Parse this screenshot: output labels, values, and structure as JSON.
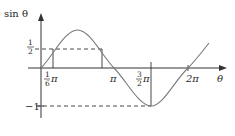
{
  "diagram": {
    "type": "function-graph",
    "function": "sin θ",
    "y_axis_label": "sin θ",
    "x_axis_label": "θ",
    "y_ticks": [
      {
        "label_num": "1",
        "label_den": "2",
        "value": 0.5
      },
      {
        "label": "−1",
        "value": -1
      }
    ],
    "x_ticks": [
      {
        "label_num": "1",
        "label_den": "6",
        "suffix": "π",
        "value": "π/6"
      },
      {
        "label": "π",
        "value": "π"
      },
      {
        "label_num": "3",
        "label_den": "2",
        "suffix": "π",
        "value": "3π/2"
      },
      {
        "label": "2π",
        "value": "2π"
      }
    ],
    "annotations": [
      "dashed line at sin θ = 1/2 from axis to curve",
      "vertical lines at θ = π/6 and θ = 5π/6",
      "dashed line at sin θ = −1 to θ = 3π/2",
      "vertical line at θ = 3π/2"
    ],
    "colors": {
      "curve": "#7a7a7a",
      "axes": "#333333",
      "guides": "#333333"
    }
  }
}
